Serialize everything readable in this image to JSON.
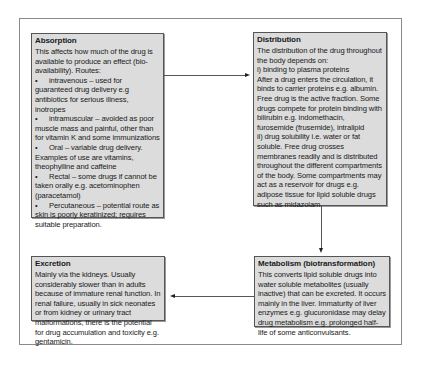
{
  "diagram": {
    "absorption": {
      "title": "Absorption",
      "intro": "This affects how much of the drug is available to produce an effect (bio-availability). Routes:",
      "routes": [
        {
          "bullet": "•",
          "text": "intravenous – used for guaranteed drug delivery e.g antibiotics for serious illness, inotropes"
        },
        {
          "bullet": "•",
          "text": "intramuscular – avoided as poor muscle mass and painful, other than for vitamin K and some immunizations"
        },
        {
          "bullet": "•",
          "text": "Oral – variable drug delivery. Examples of use are vitamins, theophylline and caffeine"
        },
        {
          "bullet": "•",
          "text": "Rectal – some drugs if cannot be taken orally e.g. acetominophen (paracetamol)"
        },
        {
          "bullet": "•",
          "text": "Percutaneous – potential route as skin is poorly keratinized; requires suitable preparation."
        }
      ]
    },
    "distribution": {
      "title": "Distribution",
      "lines": [
        "The distribution of the drug throughout the body depends on:",
        "i) binding to plasma proteins",
        "After a drug enters the circulation, it binds to carrier proteins e.g. albumin. Free drug is the active fraction. Some drugs compete for protein binding with bilirubin e.g. indomethacin, furosemide (frusemide), intralipid",
        "ii) drug solubility i.e. water or fat soluble. Free drug crosses membranes readily and is distributed throughout the different compartments of the body. Some compartments may act as a reservoir for drugs e.g. adipose tissue for lipid soluble drugs such as midazolam."
      ]
    },
    "metabolism": {
      "title": "Metabolism (biotransformation)",
      "text": "This converts lipid soluble drugs into water soluble metabolites (usually inactive) that can be excreted. It occurs mainly in the liver. Immaturity of liver enzymes e.g. glucuronidase may delay drug metabolism e.g. prolonged half-life of some anticonvulsants."
    },
    "excretion": {
      "title": "Excretion",
      "text": "Mainly via the kidneys. Usually considerably slower than in adults because of immature renal function. In renal failure, usually in sick neonates or from kidney or urinary tract malformations, there is the potential for drug accumulation and toxicity e.g. gentamicin."
    },
    "arrows": [
      {
        "from": "Absorption",
        "to": "Distribution",
        "direction": "right"
      },
      {
        "from": "Distribution",
        "to": "Metabolism (biotransformation)",
        "direction": "down"
      },
      {
        "from": "Metabolism (biotransformation)",
        "to": "Excretion",
        "direction": "left"
      }
    ],
    "colors": {
      "box_fill": "#dcdcdc",
      "box_border": "#555555",
      "frame_border": "#8a8a8a",
      "text": "#1a1a1a"
    }
  }
}
